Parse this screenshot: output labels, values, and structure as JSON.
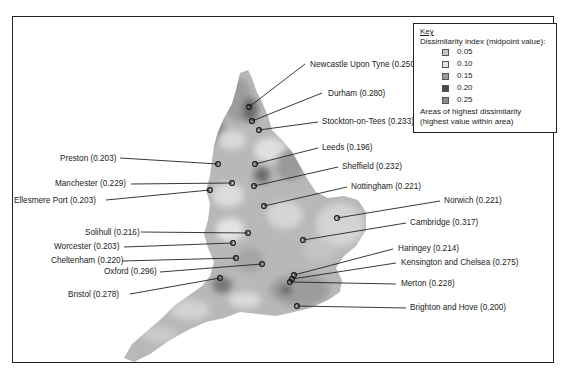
{
  "legend": {
    "title": "Key",
    "subtitle": "Dissimilarity index (midpoint value):",
    "items": [
      {
        "label": "0.05",
        "color": "#c8c8c8"
      },
      {
        "label": "0.10",
        "color": "#e4e4e4"
      },
      {
        "label": "0.15",
        "color": "#9c9c9c"
      },
      {
        "label": "0.20",
        "color": "#4a4a4a"
      },
      {
        "label": "0.25",
        "color": "#8a8a8a"
      }
    ],
    "areas_line1": "Areas of highest dissimilarity",
    "areas_line2": "(highest value within area)"
  },
  "places": [
    {
      "label": "Newcastle Upon Tyne (0.250)",
      "lx": 310,
      "ly": 60,
      "px": 249,
      "py": 107,
      "ex": 305,
      "ey": 64
    },
    {
      "label": "Durham (0.280)",
      "lx": 328,
      "ly": 89,
      "px": 252,
      "py": 121,
      "ex": 322,
      "ey": 93
    },
    {
      "label": "Stockton-on-Tees (0.233)",
      "lx": 322,
      "ly": 117,
      "px": 259,
      "py": 130,
      "ex": 318,
      "ey": 122
    },
    {
      "label": "Leeds (0.196)",
      "lx": 322,
      "ly": 143,
      "px": 255,
      "py": 164,
      "ex": 318,
      "ey": 148
    },
    {
      "label": "Preston (0.203)",
      "lx": 60,
      "ly": 154,
      "px": 218,
      "py": 164,
      "ex": 120,
      "ey": 158
    },
    {
      "label": "Sheffield (0.232)",
      "lx": 342,
      "ly": 162,
      "px": 254,
      "py": 186,
      "ex": 338,
      "ey": 167
    },
    {
      "label": "Manchester (0.229)",
      "lx": 55,
      "ly": 179,
      "px": 232,
      "py": 183,
      "ex": 131,
      "ey": 184
    },
    {
      "label": "Nottingham (0.221)",
      "lx": 351,
      "ly": 182,
      "px": 264,
      "py": 206,
      "ex": 347,
      "ey": 187
    },
    {
      "label": "Ellesmere Port (0.203)",
      "lx": 14,
      "ly": 196,
      "px": 210,
      "py": 190,
      "ex": 106,
      "ey": 200
    },
    {
      "label": "Norwich (0.221)",
      "lx": 444,
      "ly": 196,
      "px": 337,
      "py": 218,
      "ex": 440,
      "ey": 201
    },
    {
      "label": "Cambridge (0.317)",
      "lx": 410,
      "ly": 218,
      "px": 303,
      "py": 240,
      "ex": 406,
      "ey": 223
    },
    {
      "label": "Solihull (0.216)",
      "lx": 85,
      "ly": 228,
      "px": 248,
      "py": 233,
      "ex": 141,
      "ey": 232
    },
    {
      "label": "Worcester (0.203)",
      "lx": 54,
      "ly": 242,
      "px": 233,
      "py": 243,
      "ex": 124,
      "ey": 247
    },
    {
      "label": "Haringey (0.214)",
      "lx": 398,
      "ly": 244,
      "px": 294,
      "py": 275,
      "ex": 393,
      "ey": 249
    },
    {
      "label": "Cheltenham (0.220)",
      "lx": 51,
      "ly": 256,
      "px": 236,
      "py": 258,
      "ex": 122,
      "ey": 261
    },
    {
      "label": "Kensington and Chelsea (0.275)",
      "lx": 401,
      "ly": 258,
      "px": 292,
      "py": 279,
      "ex": 396,
      "ey": 263
    },
    {
      "label": "Oxford (0.296)",
      "lx": 104,
      "ly": 267,
      "px": 262,
      "py": 264,
      "ex": 160,
      "ey": 272
    },
    {
      "label": "Merton (0.228)",
      "lx": 401,
      "ly": 279,
      "px": 290,
      "py": 282,
      "ex": 396,
      "ey": 284
    },
    {
      "label": "Bristol (0.278)",
      "lx": 68,
      "ly": 290,
      "px": 220,
      "py": 278,
      "ex": 130,
      "ey": 294
    },
    {
      "label": "Brighton and Hove (0.200)",
      "lx": 410,
      "ly": 303,
      "px": 297,
      "py": 306,
      "ex": 406,
      "ey": 308
    }
  ]
}
